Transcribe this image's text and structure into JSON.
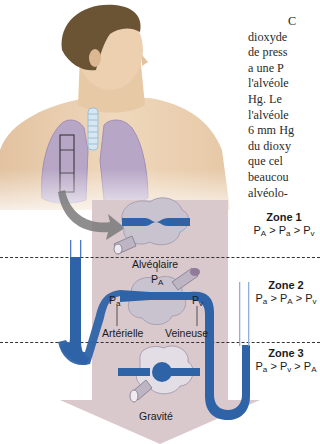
{
  "body_text": {
    "lines": [
      "C",
      "dioxyde",
      "de press",
      "a une P",
      "l'alvéole",
      "Hg. Le ",
      "l'alvéole",
      "6 mm Hg",
      "du dioxy",
      "que cel",
      "beaucou",
      "alvéolo-"
    ]
  },
  "diagram": {
    "labels": {
      "alveolaire": "Alvéolaire",
      "p_A": "P",
      "p_A_sub": "A",
      "p_a": "P",
      "p_a_sub": "a",
      "p_v": "P",
      "p_v_sub": "v",
      "arterielle": "Artérielle",
      "veineuse": "Veineuse",
      "gravite": "Gravité"
    },
    "zones": [
      {
        "title": "Zone 1",
        "rel": [
          {
            "p": "P",
            "s": "A"
          },
          {
            "p": "P",
            "s": "a"
          },
          {
            "p": "P",
            "s": "v"
          }
        ]
      },
      {
        "title": "Zone 2",
        "rel": [
          {
            "p": "P",
            "s": "a"
          },
          {
            "p": "P",
            "s": "A"
          },
          {
            "p": "P",
            "s": "v"
          }
        ]
      },
      {
        "title": "Zone 3",
        "rel": [
          {
            "p": "P",
            "s": "a"
          },
          {
            "p": "P",
            "s": "v"
          },
          {
            "p": "P",
            "s": "A"
          }
        ]
      }
    ],
    "separator": ">"
  },
  "colors": {
    "vessel_blue": "#2e63a8",
    "gravity_arrow": "#d6c4c8",
    "lung": "#b7a6c6",
    "alveolus": "#c9c3cf",
    "skin": "#e9cfae",
    "hair": "#6b5434"
  }
}
